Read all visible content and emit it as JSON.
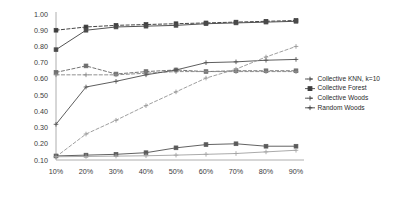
{
  "chart_data": {
    "type": "line",
    "title": "",
    "subtitle": "",
    "xlabel": "",
    "ylabel": "",
    "categories": [
      "10%",
      "20%",
      "30%",
      "40%",
      "50%",
      "60%",
      "70%",
      "80%",
      "90%"
    ],
    "x": [
      10,
      20,
      30,
      40,
      50,
      60,
      70,
      80,
      90
    ],
    "ylim": [
      0.1,
      1.0
    ],
    "yticks": [
      "1.00",
      "0.90",
      "0.80",
      "0.70",
      "0.60",
      "0.50",
      "0.40",
      "0.30",
      "0.20",
      "0.10"
    ],
    "ytick_values": [
      1.0,
      0.9,
      0.8,
      0.7,
      0.6,
      0.5,
      0.4,
      0.3,
      0.2,
      0.1
    ],
    "grid": false,
    "legend_position": "right",
    "series": [
      {
        "name": "Collective KNN, k=10",
        "style": "dashed",
        "marker": "square",
        "color": "#3c3c3c",
        "values": [
          0.9,
          0.92,
          0.93,
          0.935,
          0.94,
          0.945,
          0.95,
          0.955,
          0.96
        ]
      },
      {
        "name": "Collective Forest",
        "style": "solid",
        "marker": "square",
        "color": "#4a4a4a",
        "values": [
          0.78,
          0.9,
          0.92,
          0.925,
          0.93,
          0.94,
          0.945,
          0.95,
          0.955
        ]
      },
      {
        "name": "Collective Woods",
        "style": "dashed",
        "marker": "square",
        "color": "#6e6e6e",
        "values": [
          0.64,
          0.68,
          0.63,
          0.645,
          0.655,
          0.645,
          0.65,
          0.65,
          0.65
        ]
      },
      {
        "name": "Random Woods",
        "style": "dashed",
        "marker": "cross",
        "color": "#8a8a8a",
        "values": [
          0.625,
          0.625,
          0.625,
          0.635,
          0.645,
          0.645,
          0.645,
          0.645,
          0.645
        ]
      },
      {
        "name": "Collective Forest lower",
        "style": "solid",
        "marker": "cross",
        "color": "#555555",
        "values": [
          0.32,
          0.55,
          0.585,
          0.625,
          0.655,
          0.7,
          0.705,
          0.715,
          0.72
        ]
      },
      {
        "name": "Collective Woods rising",
        "style": "dashed",
        "marker": "cross",
        "color": "#9a9a9a",
        "values": [
          0.12,
          0.26,
          0.345,
          0.435,
          0.52,
          0.605,
          0.66,
          0.735,
          0.8
        ]
      },
      {
        "name": "Random Woods flat upper",
        "style": "solid",
        "marker": "square",
        "color": "#5a5a5a",
        "values": [
          0.125,
          0.13,
          0.135,
          0.145,
          0.175,
          0.195,
          0.2,
          0.185,
          0.185
        ]
      },
      {
        "name": "Random Woods flat lower",
        "style": "solid",
        "marker": "cross",
        "color": "#a5a5a5",
        "values": [
          0.12,
          0.122,
          0.124,
          0.126,
          0.13,
          0.135,
          0.14,
          0.15,
          0.16
        ]
      }
    ],
    "legend": [
      {
        "label": "Collective KNN, k=10",
        "style": "dashed",
        "marker": "cross"
      },
      {
        "label": "Collective Forest",
        "style": "solid",
        "marker": "square"
      },
      {
        "label": "Collective Woods",
        "style": "dashed",
        "marker": "cross"
      },
      {
        "label": "Random Woods",
        "style": "solid",
        "marker": "cross"
      }
    ]
  }
}
